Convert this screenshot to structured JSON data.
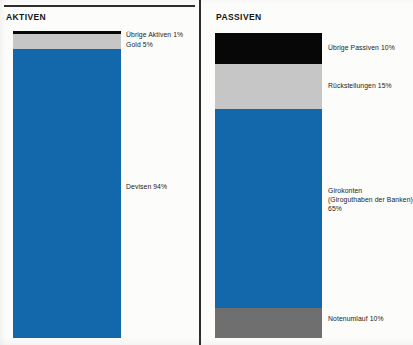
{
  "colors": {
    "blue": "#1268ab",
    "black": "#070707",
    "light_gray": "#c6c6c6",
    "dark_gray": "#6f6f6f",
    "rule": "#2d2d2d",
    "paper": "#fcfcfa",
    "text": "#232323"
  },
  "panels": {
    "left": {
      "title": "AKTIVEN"
    },
    "right": {
      "title": "PASSIVEN"
    }
  },
  "chart_data": {
    "type": "bar",
    "title": "",
    "subtitle": "",
    "xlabel": "",
    "ylabel": "",
    "ylim": [
      0,
      100
    ],
    "grid": false,
    "legend_position": "right-of-each-bar",
    "orientation": "vertical-stacked",
    "categories": [
      "AKTIVEN",
      "PASSIVEN"
    ],
    "series": [
      {
        "name": "AKTIVEN",
        "stack_order": "top-to-bottom",
        "segments": [
          {
            "label": "Übrige Aktiven 1%",
            "name": "Übrige Aktiven",
            "value": 1,
            "unit": "%",
            "color": "#070707"
          },
          {
            "label": "Gold 5%",
            "name": "Gold",
            "value": 5,
            "unit": "%",
            "color": "#c6c6c6"
          },
          {
            "label": "Devisen 94%",
            "name": "Devisen",
            "value": 94,
            "unit": "%",
            "color": "#1268ab"
          }
        ]
      },
      {
        "name": "PASSIVEN",
        "stack_order": "top-to-bottom",
        "segments": [
          {
            "label": "Übrige Passiven 10%",
            "name": "Übrige Passiven",
            "value": 10,
            "unit": "%",
            "color": "#070707"
          },
          {
            "label": "Rückstellungen 15%",
            "name": "Rückstellungen",
            "value": 15,
            "unit": "%",
            "color": "#c6c6c6"
          },
          {
            "label": "Girokonten\n(Giroguthaben der Banken)\n65%",
            "name": "Girokonten (Giroguthaben der Banken)",
            "value": 65,
            "unit": "%",
            "color": "#1268ab"
          },
          {
            "label": "Notenumlauf 10%",
            "name": "Notenumlauf",
            "value": 10,
            "unit": "%",
            "color": "#6f6f6f"
          }
        ]
      }
    ]
  }
}
